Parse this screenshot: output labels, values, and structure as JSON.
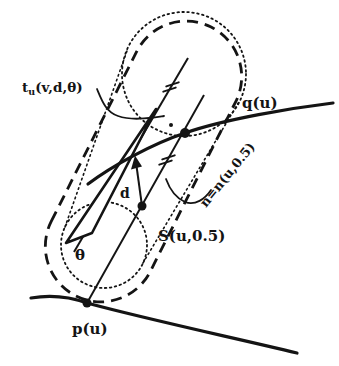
{
  "figure": {
    "background": "#ffffff",
    "ink": "#141414",
    "labels": {
      "tangent_main": "t",
      "tangent_sub": "u",
      "tangent_args": "(v,d,θ)",
      "q_curve": "q(u)",
      "normal": "n=n(u,0.5)",
      "skin_point": "S(u,0.5)",
      "distance": "d",
      "angle": "θ",
      "p_curve": "p(u)"
    }
  }
}
